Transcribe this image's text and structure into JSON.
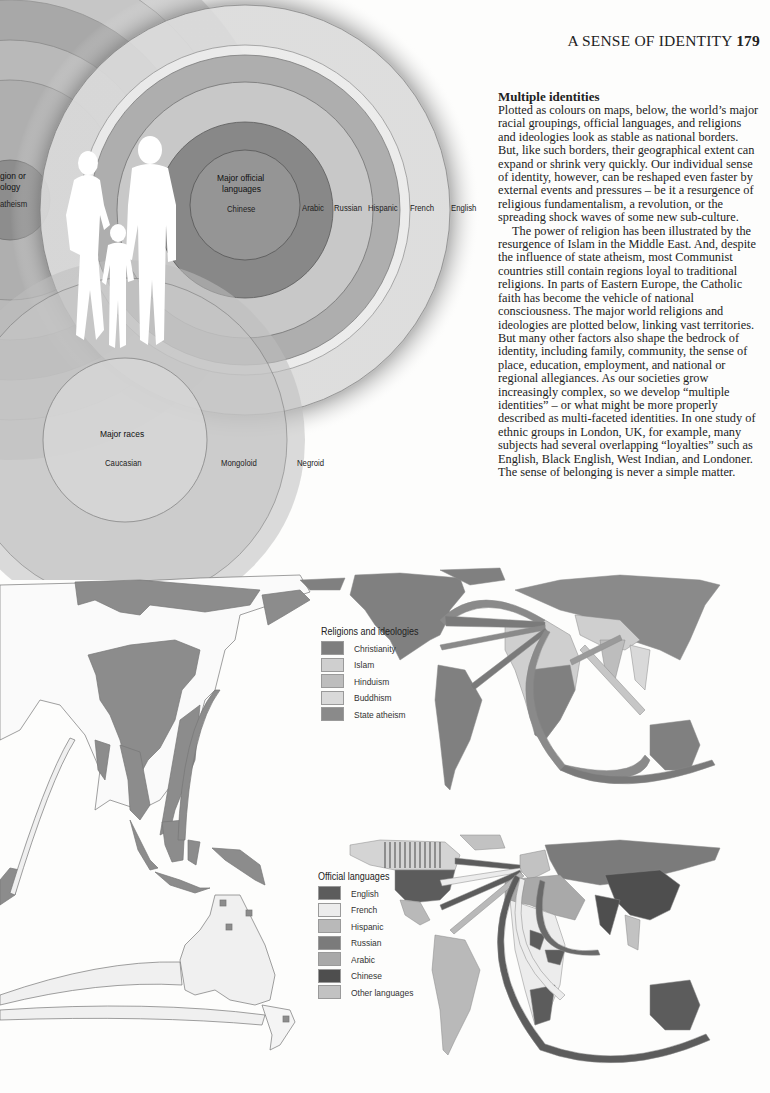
{
  "page": {
    "running_head": "A SENSE OF IDENTITY",
    "page_number": "179"
  },
  "article": {
    "heading": "Multiple identities",
    "paragraphs": [
      "Plotted as colours on maps, below, the world’s major racial groupings, official languages, and religions and ideologies look as stable as national borders. But, like such borders, their geographical extent can expand or shrink very quickly. Our individual sense of identity, however, can be reshaped even faster by external events and pressures – be it a resurgence of religious fundamentalism, a revolution, or the spreading shock waves of some new sub-culture.",
      "The power of religion has been illustrated by the resurgence of Islam in the Middle East. And, despite the influence of state atheism, most Communist countries still contain regions loyal to traditional religions. In parts of Eastern Europe, the Catholic faith has become the vehicle of national consciousness. The major world religions and ideologies are plotted below, linking vast territories. But many other factors also shape the bedrock of identity, including family, community, the sense of place, education, employment, and national or regional allegiances. As our societies grow increasingly complex, so we develop “multiple identities” – or what might be more properly described as multi-faceted identities. In one study of ethnic groups in London, UK, for example, many subjects had several overlapping “loyalties” such as English, Black English, West Indian, and Londoner. The sense of belonging is never a simple matter."
    ]
  },
  "diagram": {
    "religion_circle": {
      "title_line1": "gion or",
      "title_line2": "ology",
      "inner_label": "atheism"
    },
    "languages_circle": {
      "title_line1": "Major official",
      "title_line2": "languages",
      "rings": [
        "Chinese",
        "Arabic",
        "Russian",
        "Hispanic",
        "French",
        "English"
      ]
    },
    "races_circle": {
      "title": "Major races",
      "rings": [
        "Caucasian",
        "Mongoloid",
        "Negroid"
      ]
    },
    "figure": "family-silhouette"
  },
  "maps": {
    "religions": {
      "legend_title": "Religions and ideologies",
      "items": [
        {
          "label": "Christianity",
          "color": "#7e7e7e"
        },
        {
          "label": "Islam",
          "color": "#cfcfcf"
        },
        {
          "label": "Hinduism",
          "color": "#bdbdbd"
        },
        {
          "label": "Buddhism",
          "color": "#d9d9d9"
        },
        {
          "label": "State atheism",
          "color": "#8a8a8a"
        }
      ]
    },
    "languages": {
      "legend_title": "Official languages",
      "items": [
        {
          "label": "English",
          "color": "#5c5c5c"
        },
        {
          "label": "French",
          "color": "#ececec"
        },
        {
          "label": "Hispanic",
          "color": "#b9b9b9"
        },
        {
          "label": "Russian",
          "color": "#7b7b7b"
        },
        {
          "label": "Arabic",
          "color": "#a9a9a9"
        },
        {
          "label": "Chinese",
          "color": "#4e4e4e"
        },
        {
          "label": "Other languages",
          "color": "#c2c2c2"
        }
      ]
    },
    "races_map": {
      "fill": "#8c8c8c"
    }
  }
}
